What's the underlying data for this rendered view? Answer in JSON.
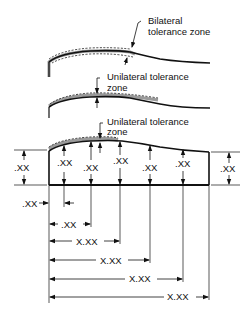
{
  "colors": {
    "line": "#111111",
    "zone": "#9a9a9a",
    "background": "#ffffff"
  },
  "callouts": {
    "bilateral": {
      "line1": "Bilateral",
      "line2": "tolerance zone"
    },
    "unilateral_1": {
      "line1": "Unilateral tolerance",
      "line2": "zone"
    },
    "unilateral_2": {
      "line1": "Unilateral tolerance",
      "line2": "zone"
    }
  },
  "heights": {
    "left": ".XX",
    "right": ".XX",
    "stations": [
      ".XX",
      ".XX",
      ".XX",
      ".XX",
      ".XX"
    ]
  },
  "horizontal_dims": {
    "first_offset": ".XX",
    "rows": [
      ".XX",
      "X.XX",
      "X.XX",
      "X.XX",
      "X.XX"
    ]
  }
}
